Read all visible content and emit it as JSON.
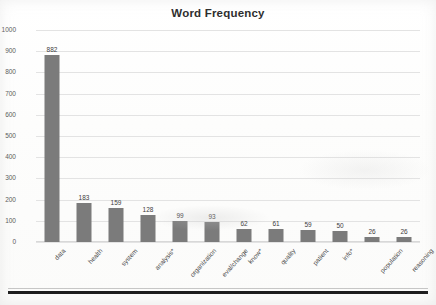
{
  "chart_data": {
    "type": "bar",
    "title": "Word Frequency",
    "xlabel": "",
    "ylabel": "",
    "ylim": [
      0,
      1000
    ],
    "ytick_step": 100,
    "yticks": [
      "1000",
      "900",
      "800",
      "700",
      "600",
      "500",
      "400",
      "300",
      "200",
      "100",
      "0"
    ],
    "grid": true,
    "legend": "none",
    "bar_color": "#7b7b7b",
    "categories": [
      "data",
      "health",
      "system",
      "analysis*",
      "organization",
      "eval/change",
      "know*",
      "quality",
      "patient",
      "info*",
      "population",
      "reasoning"
    ],
    "values": [
      882,
      183,
      159,
      128,
      99,
      93,
      62,
      61,
      59,
      50,
      26,
      26
    ],
    "value_labels": [
      "882",
      "183",
      "159",
      "128",
      "99",
      "93",
      "62",
      "61",
      "59",
      "50",
      "26",
      "26"
    ]
  }
}
